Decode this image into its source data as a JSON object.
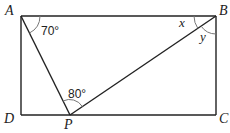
{
  "diagram": {
    "type": "geometry",
    "shape": "rectangle ABCD with point P on DC",
    "points": {
      "A": {
        "label": "A",
        "x": 21,
        "y": 16
      },
      "B": {
        "label": "B",
        "x": 216,
        "y": 16
      },
      "C": {
        "label": "C",
        "x": 216,
        "y": 115
      },
      "D": {
        "label": "D",
        "x": 21,
        "y": 115
      },
      "P": {
        "label": "P",
        "x": 70,
        "y": 115
      }
    },
    "segments": [
      "AB",
      "BC",
      "CD",
      "DA",
      "AP",
      "BP"
    ],
    "angles": {
      "DAP": {
        "label": "70°",
        "vertex": "A"
      },
      "APB": {
        "label": "80°",
        "vertex": "P"
      },
      "ABP": {
        "label": "x",
        "vertex": "B"
      },
      "PBC": {
        "label": "y",
        "vertex": "B"
      }
    },
    "colors": {
      "line": "#222222",
      "arc": "#777777",
      "background": "#ffffff"
    }
  }
}
